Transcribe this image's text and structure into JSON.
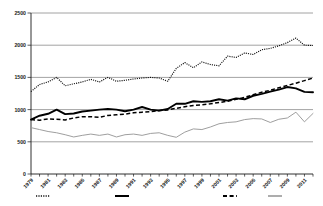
{
  "chart_data": {
    "type": "line",
    "title": "",
    "subtitle": "",
    "xlabel": "",
    "ylabel": "",
    "ylim": [
      0,
      2500
    ],
    "xlim": [
      1979,
      2012
    ],
    "grid": true,
    "y_ticks": [
      0,
      500,
      1000,
      1500,
      2000,
      2500
    ],
    "y_tick_labels": [
      "0",
      "500",
      "1000",
      "1500",
      "2000",
      "2500"
    ],
    "x": [
      1979,
      1980,
      1981,
      1982,
      1983,
      1984,
      1985,
      1986,
      1987,
      1988,
      1989,
      1990,
      1991,
      1992,
      1993,
      1994,
      1995,
      1996,
      1997,
      1998,
      1999,
      2000,
      2001,
      2002,
      2003,
      2004,
      2005,
      2006,
      2007,
      2008,
      2009,
      2010,
      2011,
      2012
    ],
    "x_tick_labels": [
      "1979",
      "1981",
      "1983",
      "1985",
      "1987",
      "1989",
      "1991",
      "1993",
      "1995",
      "1997",
      "1999",
      "2001",
      "2003",
      "2005",
      "2007",
      "2009",
      "2011"
    ],
    "x_tick_values": [
      1979,
      1981,
      1983,
      1985,
      1987,
      1989,
      1991,
      1993,
      1995,
      1997,
      1999,
      2001,
      2003,
      2005,
      2007,
      2009,
      2011
    ],
    "legend_position": "below-axis",
    "legend_labels_visible": false,
    "series": [
      {
        "name": "series-dotted",
        "style": "dotted",
        "color": "#111111",
        "values": [
          1280,
          1390,
          1430,
          1500,
          1370,
          1400,
          1430,
          1470,
          1430,
          1500,
          1440,
          1455,
          1475,
          1490,
          1500,
          1490,
          1440,
          1640,
          1730,
          1650,
          1740,
          1700,
          1680,
          1830,
          1810,
          1880,
          1855,
          1930,
          1950,
          1990,
          2040,
          2110,
          2000,
          1995
        ]
      },
      {
        "name": "series-thick-solid",
        "style": "solid-thick",
        "color": "#000000",
        "values": [
          845,
          905,
          935,
          1000,
          930,
          940,
          970,
          985,
          1000,
          1010,
          1000,
          975,
          1000,
          1040,
          1000,
          985,
          1010,
          1090,
          1090,
          1130,
          1120,
          1130,
          1160,
          1140,
          1175,
          1160,
          1215,
          1245,
          1280,
          1310,
          1350,
          1330,
          1275,
          1270
        ]
      },
      {
        "name": "series-dashed",
        "style": "dashed",
        "color": "#000000",
        "values": [
          845,
          835,
          855,
          850,
          840,
          870,
          890,
          890,
          880,
          910,
          920,
          930,
          950,
          960,
          970,
          985,
          995,
          1020,
          1045,
          1065,
          1075,
          1090,
          1110,
          1130,
          1160,
          1190,
          1230,
          1270,
          1300,
          1340,
          1375,
          1410,
          1450,
          1490
        ]
      },
      {
        "name": "series-thin-gray",
        "style": "solid-thin",
        "color": "#999999",
        "values": [
          720,
          690,
          660,
          640,
          610,
          575,
          600,
          620,
          600,
          620,
          575,
          610,
          620,
          600,
          630,
          640,
          600,
          570,
          650,
          700,
          690,
          730,
          780,
          800,
          810,
          845,
          860,
          855,
          800,
          850,
          870,
          960,
          810,
          940
        ]
      }
    ],
    "legend_markers": [
      {
        "name": "legend-marker-dotted",
        "style": "dotted",
        "color": "#111111",
        "x_center": 43
      },
      {
        "name": "legend-marker-thick-solid",
        "style": "solid-thick",
        "color": "#000000",
        "x_center": 122
      },
      {
        "name": "legend-marker-dashed",
        "style": "dashed",
        "color": "#000000",
        "x_center": 230
      },
      {
        "name": "legend-marker-thin-gray",
        "style": "solid-thin",
        "color": "#999999",
        "x_center": 275
      }
    ]
  }
}
